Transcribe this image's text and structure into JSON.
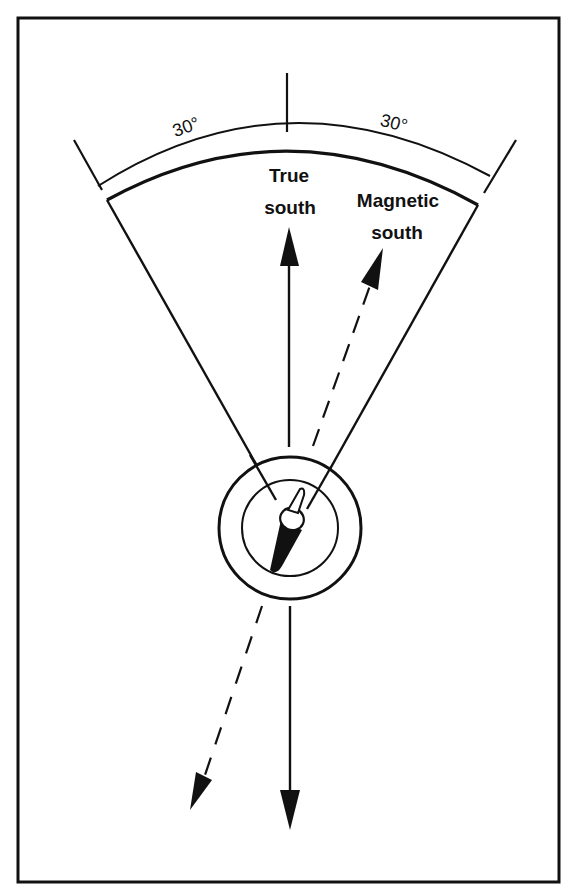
{
  "diagram": {
    "labels": {
      "true_south_line1": "True",
      "true_south_line2": "south",
      "magnetic_south_line1": "Magnetic",
      "magnetic_south_line2": "south",
      "angle_left": "30°",
      "angle_right": "30°"
    },
    "colors": {
      "ink": "#111111",
      "background": "#ffffff"
    },
    "elements": {
      "true_south_arrow": "solid vertical arrow pointing up (true south) and down",
      "magnetic_south_arrow": "dashed arrow angled to the right (magnetic south) and opposite direction",
      "compass": "concentric circles with needle",
      "sector": "60 degree wedge with arc"
    }
  }
}
